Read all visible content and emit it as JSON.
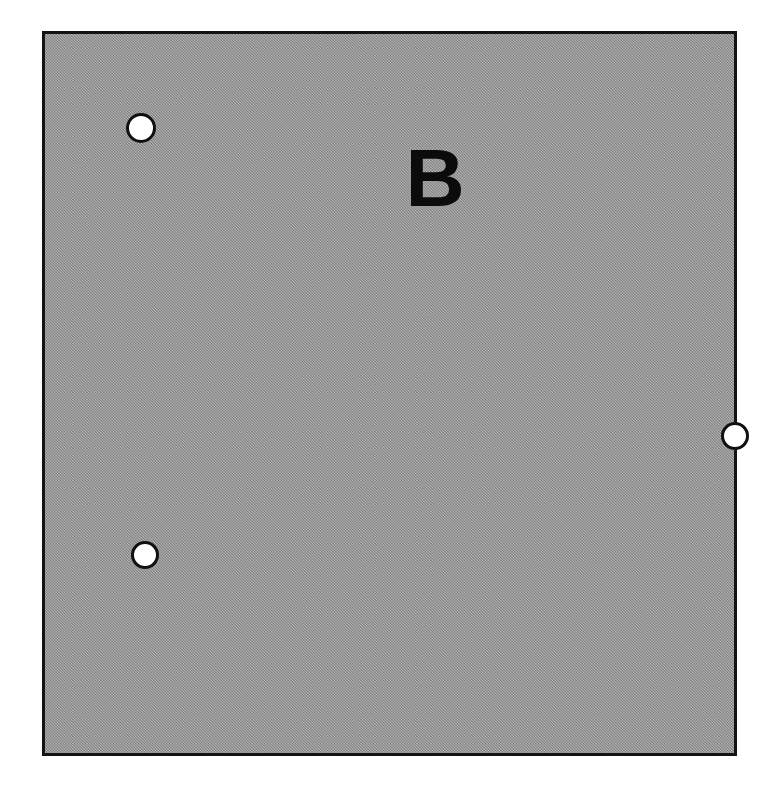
{
  "figure": {
    "panel_label": "B",
    "panel_label_name": "panel-letter-b",
    "background_color": "#ffffff",
    "panel": {
      "fill_color": "#a9a9a9",
      "fill_style": "dithered-halftone-gray",
      "border_color": "#131313",
      "border_width_px": 3,
      "shape": "rectangle",
      "x_px": 42,
      "y_px": 31,
      "width_px": 695,
      "height_px": 725
    },
    "holes": [
      {
        "id": "hole-top-left",
        "label": "top-left hole",
        "fill_color": "#ffffff",
        "outline_color": "#101010",
        "center_x_px": 96,
        "center_y_px": 94,
        "diameter_px": 30
      },
      {
        "id": "hole-bottom-left",
        "label": "lower-left hole",
        "fill_color": "#ffffff",
        "outline_color": "#101010",
        "center_x_px": 100,
        "center_y_px": 521,
        "diameter_px": 28
      },
      {
        "id": "hole-right",
        "label": "right-edge hole",
        "fill_color": "#ffffff",
        "outline_color": "#101010",
        "center_x_px": 690,
        "center_y_px": 402,
        "diameter_px": 28
      }
    ],
    "hole_count": 3
  }
}
